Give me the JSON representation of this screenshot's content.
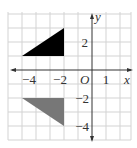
{
  "diagram": {
    "type": "coordinate-grid",
    "x_range": [
      -6,
      3
    ],
    "y_range": [
      -5,
      4
    ],
    "axis_labels": {
      "x": "x",
      "y": "y",
      "origin": "O"
    },
    "x_tick_labels": [
      "−4",
      "−2",
      "1"
    ],
    "y_tick_labels": [
      "2",
      "−2",
      "−4"
    ],
    "shapes": [
      {
        "name": "black-triangle",
        "fill": "#000000",
        "vertices": [
          [
            -5,
            1
          ],
          [
            -2,
            1
          ],
          [
            -2,
            3
          ]
        ]
      },
      {
        "name": "gray-triangle",
        "fill": "#777777",
        "vertices": [
          [
            -5,
            -2
          ],
          [
            -2,
            -2
          ],
          [
            -2,
            -4
          ]
        ]
      }
    ],
    "colors": {
      "grid": "#d0d0d0",
      "axis": "#333333"
    }
  }
}
